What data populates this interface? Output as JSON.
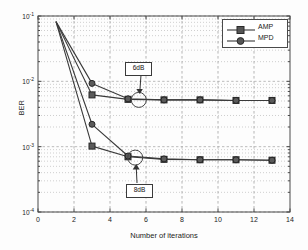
{
  "chart_data": {
    "type": "line",
    "title": "",
    "xlabel": "Number of iterations",
    "ylabel": "BER",
    "xlim": [
      0,
      14
    ],
    "ylim": [
      0.0001,
      0.1
    ],
    "yscale": "log",
    "grid": true,
    "grid_minor": true,
    "legend_position": "upper right",
    "xticks": [
      "0",
      "2",
      "4",
      "6",
      "8",
      "10",
      "12",
      "14"
    ],
    "xtick_values": [
      0,
      2,
      4,
      6,
      8,
      10,
      12,
      14
    ],
    "ytick_labels": [
      "10^-1",
      "10^-2",
      "10^-3",
      "10^-4"
    ],
    "ytick_values": [
      0.1,
      0.01,
      0.001,
      0.0001
    ],
    "legend": [
      {
        "name": "AMP",
        "marker": "square"
      },
      {
        "name": "MPD",
        "marker": "circle"
      }
    ],
    "annotations": [
      {
        "text": "6dB",
        "points_to_x": 5.6,
        "points_to_y": 0.0052
      },
      {
        "text": "8dB",
        "points_to_x": 5.4,
        "points_to_y": 0.00068
      }
    ],
    "series": [
      {
        "name": "AMP 6dB",
        "marker": "square",
        "snr": "6dB",
        "x": [
          1,
          3,
          5,
          7,
          9,
          11,
          13
        ],
        "y": [
          0.082,
          0.0062,
          0.0053,
          0.0052,
          0.0052,
          0.0051,
          0.0051
        ]
      },
      {
        "name": "MPD 6dB",
        "marker": "circle",
        "snr": "6dB",
        "x": [
          1,
          3,
          5,
          7,
          9,
          11,
          13
        ],
        "y": [
          0.082,
          0.0093,
          0.0054,
          0.0052,
          0.0052,
          0.0051,
          0.0051
        ]
      },
      {
        "name": "AMP 8dB",
        "marker": "square",
        "snr": "8dB",
        "x": [
          1,
          3,
          5,
          7,
          9,
          11,
          13
        ],
        "y": [
          0.082,
          0.00102,
          0.0007,
          0.00064,
          0.00063,
          0.00063,
          0.00062
        ]
      },
      {
        "name": "MPD 8dB",
        "marker": "circle",
        "snr": "8dB",
        "x": [
          1,
          3,
          5,
          7,
          9,
          11,
          13
        ],
        "y": [
          0.082,
          0.0022,
          0.00072,
          0.00065,
          0.00063,
          0.00063,
          0.00062
        ]
      }
    ]
  },
  "figure": {
    "line_color": "#3a3a3a",
    "axis_color": "#4a4a4a",
    "grid_color": "#b9b9b9",
    "background": "#fdfdfd"
  }
}
